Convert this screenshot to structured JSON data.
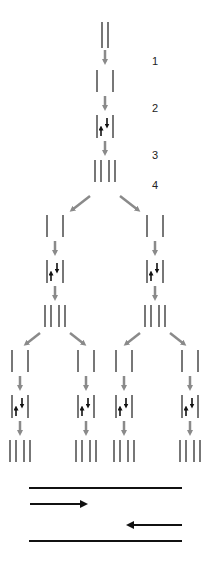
{
  "diagram": {
    "type": "dna-replication-schematic",
    "step_labels": [
      "1",
      "2",
      "3",
      "4"
    ],
    "colors": {
      "strand": "#555555",
      "flow_arrow": "#8a8a8a",
      "direction_arrow": "#111111",
      "legend_line": "#111111"
    },
    "legend": {
      "items": [
        "top-strand-line",
        "rightward-arrow",
        "leftward-arrow",
        "bottom-strand-line"
      ]
    }
  }
}
